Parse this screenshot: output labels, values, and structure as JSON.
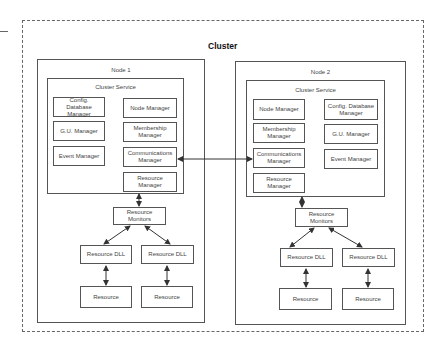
{
  "cluster": {
    "title": "Cluster"
  },
  "nodes": [
    {
      "title": "Node 1",
      "service": {
        "title": "Cluster Service",
        "left_column": [
          "Config. Database Manager",
          "G.U. Manager",
          "Event Manager"
        ],
        "right_column": [
          "Node Manager",
          "Membership Manager",
          "Communications Manager",
          "Resource Manager"
        ]
      },
      "monitors": "Resource Monitors",
      "dlls": [
        "Resource DLL",
        "Resource DLL"
      ],
      "resources": [
        "Resource",
        "Resource"
      ]
    },
    {
      "title": "Node 2",
      "service": {
        "title": "Cluster Service",
        "left_column": [
          "Node Manager",
          "Membership Manager",
          "Communications Manager",
          "Resource Manager"
        ],
        "right_column": [
          "Config. Database Manager",
          "G.U. Manager",
          "Event Manager"
        ]
      },
      "monitors": "Resource Monitors",
      "dlls": [
        "Resource DLL",
        "Resource DLL"
      ],
      "resources": [
        "Resource",
        "Resource"
      ]
    }
  ],
  "connections": [
    {
      "from": "Node 1 Communications Manager",
      "to": "Node 2 Communications Manager",
      "type": "bidirectional"
    },
    {
      "from": "Resource Manager",
      "to": "Resource Monitors",
      "type": "bidirectional"
    },
    {
      "from": "Resource Monitors",
      "to": "Resource DLL",
      "type": "bidirectional"
    },
    {
      "from": "Resource DLL",
      "to": "Resource",
      "type": "bidirectional"
    }
  ],
  "colors": {
    "line": "#555555",
    "background": "#ffffff",
    "text": "#444444"
  }
}
